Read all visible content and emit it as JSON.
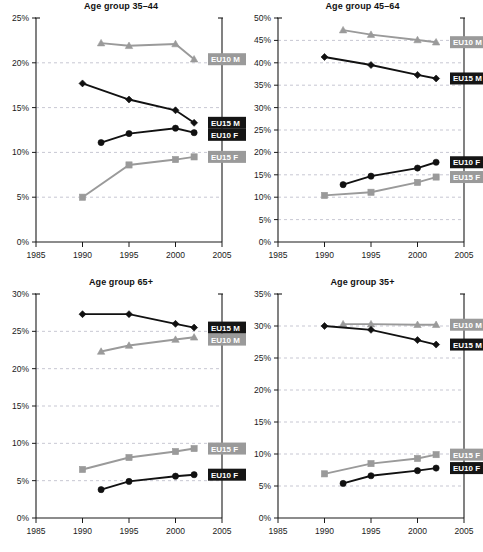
{
  "figure": {
    "series_names": [
      "EU10 M",
      "EU15 M",
      "EU10 F",
      "EU15 F"
    ],
    "colors": {
      "dark": "#111111",
      "light": "#9a9a9a",
      "grid": "#b9b9c6",
      "axis": "#1a1a1a"
    },
    "xticks": [
      "1985",
      "1990",
      "1995",
      "2000",
      "2005"
    ]
  },
  "chart_data": [
    {
      "type": "line",
      "title": "Age group 35–44",
      "xlabel": "",
      "ylabel": "",
      "xlim": [
        1985,
        2005
      ],
      "ylim": [
        0,
        25
      ],
      "grid": true,
      "legend_position": "right-inline",
      "xticks": [
        1985,
        1990,
        1995,
        2000,
        2005
      ],
      "yticks": [
        "0%",
        "5%",
        "10%",
        "15%",
        "20%",
        "25%"
      ],
      "series": [
        {
          "name": "EU10 M",
          "marker": "triangle",
          "color": "#9a9a9a",
          "x": [
            1992,
            1995,
            2000,
            2002
          ],
          "values": [
            22.2,
            21.9,
            22.1,
            20.4
          ]
        },
        {
          "name": "EU15 M",
          "marker": "diamond",
          "color": "#111111",
          "x": [
            1990,
            1995,
            2000,
            2002
          ],
          "values": [
            17.7,
            15.9,
            14.7,
            13.3
          ]
        },
        {
          "name": "EU10 F",
          "marker": "circle",
          "color": "#111111",
          "x": [
            1992,
            1995,
            2000,
            2002
          ],
          "values": [
            11.1,
            12.1,
            12.7,
            12.2
          ]
        },
        {
          "name": "EU15 F",
          "marker": "square",
          "color": "#9a9a9a",
          "x": [
            1990,
            1995,
            2000,
            2002
          ],
          "values": [
            5.0,
            8.6,
            9.2,
            9.5
          ]
        }
      ]
    },
    {
      "type": "line",
      "title": "Age group 45–64",
      "xlabel": "",
      "ylabel": "",
      "xlim": [
        1985,
        2005
      ],
      "ylim": [
        0,
        50
      ],
      "grid": true,
      "legend_position": "right-inline",
      "xticks": [
        1985,
        1990,
        1995,
        2000,
        2005
      ],
      "yticks": [
        "0%",
        "5%",
        "10%",
        "15%",
        "20%",
        "25%",
        "30%",
        "35%",
        "40%",
        "45%",
        "50%"
      ],
      "series": [
        {
          "name": "EU10 M",
          "marker": "triangle",
          "color": "#9a9a9a",
          "x": [
            1992,
            1995,
            2000,
            2002
          ],
          "values": [
            47.3,
            46.3,
            45.1,
            44.6
          ]
        },
        {
          "name": "EU15 M",
          "marker": "diamond",
          "color": "#111111",
          "x": [
            1990,
            1995,
            2000,
            2002
          ],
          "values": [
            41.3,
            39.5,
            37.3,
            36.5
          ]
        },
        {
          "name": "EU10 F",
          "marker": "circle",
          "color": "#111111",
          "x": [
            1992,
            1995,
            2000,
            2002
          ],
          "values": [
            12.8,
            14.7,
            16.5,
            17.8
          ]
        },
        {
          "name": "EU15 F",
          "marker": "square",
          "color": "#9a9a9a",
          "x": [
            1990,
            1995,
            2000,
            2002
          ],
          "values": [
            10.4,
            11.1,
            13.3,
            14.5
          ]
        }
      ]
    },
    {
      "type": "line",
      "title": "Age group 65+",
      "xlabel": "",
      "ylabel": "",
      "xlim": [
        1985,
        2005
      ],
      "ylim": [
        0,
        30
      ],
      "grid": true,
      "legend_position": "right-inline",
      "xticks": [
        1985,
        1990,
        1995,
        2000,
        2005
      ],
      "yticks": [
        "0%",
        "5%",
        "10%",
        "15%",
        "20%",
        "25%",
        "30%"
      ],
      "series": [
        {
          "name": "EU10 M",
          "marker": "triangle",
          "color": "#9a9a9a",
          "x": [
            1992,
            1995,
            2000,
            2002
          ],
          "values": [
            22.3,
            23.1,
            23.9,
            24.2
          ]
        },
        {
          "name": "EU15 M",
          "marker": "diamond",
          "color": "#111111",
          "x": [
            1990,
            1995,
            2000,
            2002
          ],
          "values": [
            27.3,
            27.3,
            26.0,
            25.5
          ]
        },
        {
          "name": "EU10 F",
          "marker": "circle",
          "color": "#111111",
          "x": [
            1992,
            1995,
            2000,
            2002
          ],
          "values": [
            3.8,
            4.9,
            5.6,
            5.8
          ]
        },
        {
          "name": "EU15 F",
          "marker": "square",
          "color": "#9a9a9a",
          "x": [
            1990,
            1995,
            2000,
            2002
          ],
          "values": [
            6.5,
            8.1,
            8.9,
            9.3
          ]
        }
      ]
    },
    {
      "type": "line",
      "title": "Age group 35+",
      "xlabel": "",
      "ylabel": "",
      "xlim": [
        1985,
        2005
      ],
      "ylim": [
        0,
        35
      ],
      "grid": true,
      "legend_position": "right-inline",
      "xticks": [
        1985,
        1990,
        1995,
        2000,
        2005
      ],
      "yticks": [
        "0%",
        "5%",
        "10%",
        "15%",
        "20%",
        "25%",
        "30%",
        "35%"
      ],
      "series": [
        {
          "name": "EU10 M",
          "marker": "triangle",
          "color": "#9a9a9a",
          "x": [
            1992,
            1995,
            2000,
            2002
          ],
          "values": [
            30.3,
            30.3,
            30.2,
            30.2
          ]
        },
        {
          "name": "EU15 M",
          "marker": "diamond",
          "color": "#111111",
          "x": [
            1990,
            1995,
            2000,
            2002
          ],
          "values": [
            30.0,
            29.4,
            27.8,
            27.1
          ]
        },
        {
          "name": "EU10 F",
          "marker": "circle",
          "color": "#111111",
          "x": [
            1992,
            1995,
            2000,
            2002
          ],
          "values": [
            5.4,
            6.6,
            7.4,
            7.8
          ]
        },
        {
          "name": "EU15 F",
          "marker": "square",
          "color": "#9a9a9a",
          "x": [
            1990,
            1995,
            2000,
            2002
          ],
          "values": [
            6.9,
            8.5,
            9.3,
            9.9
          ]
        }
      ]
    }
  ]
}
